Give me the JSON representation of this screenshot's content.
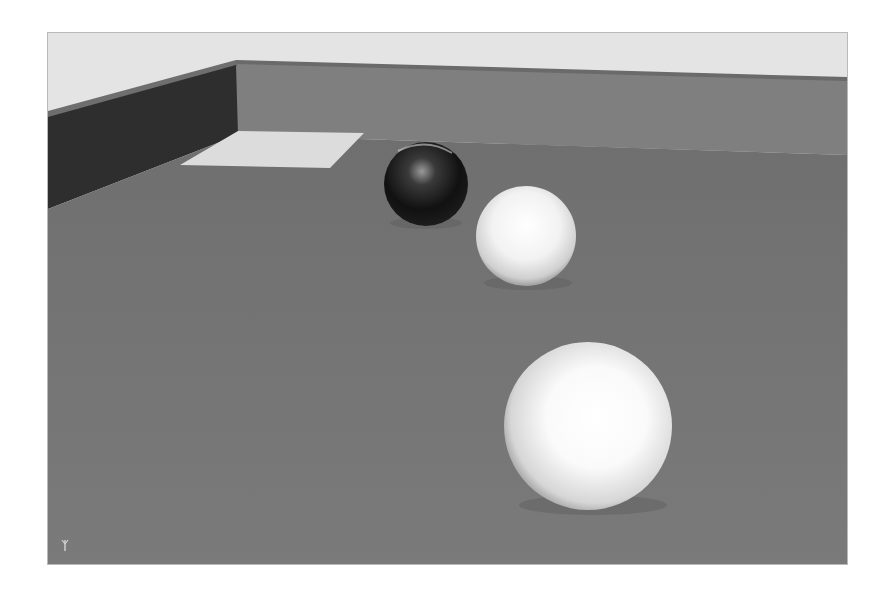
{
  "viewport": {
    "name": "3D render viewport",
    "colors": {
      "sky": "#e4e4e4",
      "floor": "#767676",
      "back_wall_face": "#7f7f7f",
      "left_wall_face": "#2e2e2e",
      "wall_top": "#6e6e6e",
      "light_patch": "#dcdcdc",
      "border": "#b9b9b9"
    },
    "objects": [
      {
        "id": "dark-sphere",
        "type": "sphere",
        "material": "glossy black",
        "cx": 378,
        "cy": 151,
        "r": 42
      },
      {
        "id": "white-sphere-small",
        "type": "sphere",
        "material": "matte white",
        "cx": 478,
        "cy": 203,
        "r": 50
      },
      {
        "id": "white-sphere-large",
        "type": "sphere",
        "material": "matte white",
        "cx": 540,
        "cy": 393,
        "r": 84
      }
    ],
    "axis_gizmo": "y-axis"
  }
}
